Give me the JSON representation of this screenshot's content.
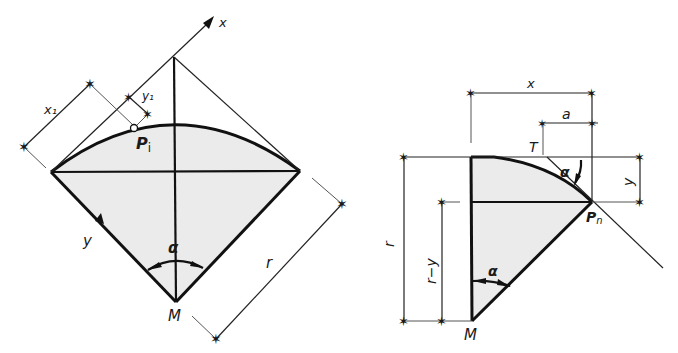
{
  "figure_left": {
    "title": "Circular segment with x-y coordinate system along tangent",
    "labels": {
      "axis_x": "x",
      "axis_y": "y",
      "x1": "x₁",
      "y1": "y₁",
      "point": "P",
      "point_sub": "i",
      "angle": "α",
      "radius": "r",
      "center": "M"
    }
  },
  "figure_right": {
    "title": "Quarter-sector with tangent offset dimensions",
    "labels": {
      "x": "x",
      "a": "a",
      "tangent_point": "T",
      "angle_top": "α",
      "y": "y",
      "point": "P",
      "point_sub": "n",
      "radius": "r",
      "r_minus_y": "r−y",
      "angle_bottom": "α",
      "center": "M"
    }
  },
  "colors": {
    "line": "#111111",
    "shade": "#ebebeb",
    "background": "#ffffff"
  }
}
